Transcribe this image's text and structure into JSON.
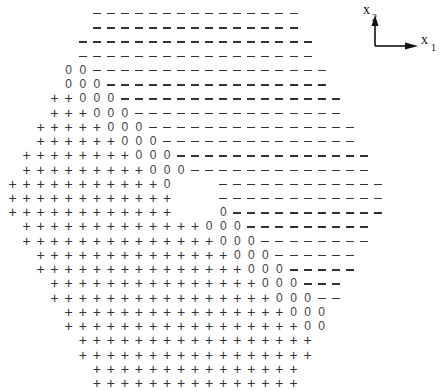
{
  "figure": {
    "symbols": {
      "plus": "+",
      "zero": "0",
      "minus": "-"
    },
    "grid": {
      "columns": 27,
      "origin_x": 12.5,
      "step_x": 14.05,
      "origin_y": 13,
      "step_y": 14.23,
      "rows": [
        "      ---------------      ",
        "      ---------------      ",
        "     -----------------     ",
        "     -----------------     ",
        "    00-----------------    ",
        "    000----------------    ",
        "   ++000----------------   ",
        "   +++000---------------   ",
        "  +++++000---------------  ",
        "  ++++++000--------------  ",
        " ++++++++000-------------- ",
        " +++++++++000------------- ",
        "+++++++++++0   ------------",
        "++++++++++++   ------------",
        "++++++++++++   0-----------",
        " +++++++++++++000--------- ",
        " ++++++++++++++000-------- ",
        "  ++++++++++++++000------  ",
        "  +++++++++++++++000-----  ",
        "   +++++++++++++++000---   ",
        "   ++++++++++++++++000--   ",
        "    ++++++++++++++++000    ",
        "    +++++++++++++++++00    ",
        "     +++++++++++++++++     ",
        "     +++++++++++++++++     ",
        "      +++++++++++++++      ",
        "      +++++++++++++++      "
      ]
    },
    "axes": {
      "x1_label": "x",
      "x1_subscript": "1",
      "x2_label": "x",
      "x2_subscript": "2"
    }
  }
}
